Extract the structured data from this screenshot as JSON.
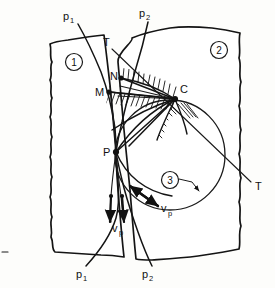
{
  "regions": [
    {
      "id": "region-1",
      "label": "1",
      "cx": 74,
      "cy": 62
    },
    {
      "id": "region-2",
      "label": "2",
      "cx": 219,
      "cy": 50
    },
    {
      "id": "region-3",
      "label": "3",
      "cx": 170,
      "cy": 180
    }
  ],
  "points": [
    {
      "id": "point-N",
      "label": "N",
      "x": 121,
      "y": 78,
      "lx": 110,
      "ly": 80
    },
    {
      "id": "point-M",
      "label": "M",
      "x": 109,
      "y": 92,
      "lx": 96,
      "ly": 95
    },
    {
      "id": "point-C",
      "label": "C",
      "x": 175,
      "y": 99,
      "lx": 180,
      "ly": 92
    },
    {
      "id": "point-P",
      "label": "P",
      "x": 116,
      "y": 152,
      "lx": 104,
      "ly": 155
    }
  ],
  "labels": {
    "p1_top": {
      "base": "p",
      "sub": "1",
      "x": 65,
      "y": 19
    },
    "p2_top": {
      "base": "p",
      "sub": "2",
      "x": 140,
      "y": 16
    },
    "t_top": {
      "base": "T",
      "x": 105,
      "y": 44
    },
    "t_bottom": {
      "base": "T",
      "x": 257,
      "y": 187
    },
    "p1_bottom": {
      "base": "p",
      "sub": "1",
      "x": 78,
      "y": 277
    },
    "p2_bottom": {
      "base": "p",
      "sub": "2",
      "x": 144,
      "y": 277
    },
    "vp_lower": {
      "base": "v",
      "sub": "p",
      "x": 113,
      "y": 231
    },
    "vp_right": {
      "base": "v",
      "sub": "p",
      "x": 163,
      "y": 211
    }
  },
  "colors": {
    "ink": "#141414",
    "paper": "#fdfdfb",
    "hatch": "#141414"
  },
  "geometry": {
    "circle": {
      "cx": 170,
      "cy": 155,
      "r": 55
    },
    "crack_tip": {
      "x": 116,
      "y": 152
    },
    "tangent_line": {
      "x1": 113,
      "y1": 48,
      "x2": 250,
      "y2": 183
    }
  }
}
